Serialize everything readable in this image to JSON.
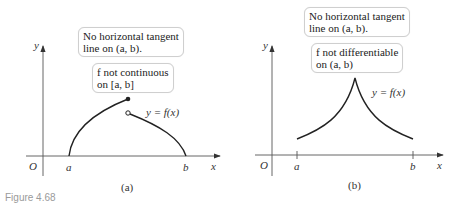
{
  "figure": {
    "caption": "Figure 4.68",
    "panels": [
      {
        "label": "(a)",
        "axis_labels": {
          "origin": "O",
          "x": "x",
          "y": "y",
          "a": "a",
          "b": "b"
        },
        "curve_label": "y = f(x)",
        "notes": [
          {
            "line1": "No horizontal tangent",
            "line2": "line on (a, b)."
          },
          {
            "line1": "f not continuous",
            "line2": "on [a, b]"
          }
        ],
        "markers": {
          "filled_point": "endpoint of left piece",
          "open_point": "start of right piece"
        }
      },
      {
        "label": "(b)",
        "axis_labels": {
          "origin": "O",
          "x": "x",
          "y": "y",
          "a": "a",
          "b": "b"
        },
        "curve_label": "y = f(x)",
        "notes": [
          {
            "line1": "No horizontal tangent",
            "line2": "line on (a, b)."
          },
          {
            "line1": "f  not differentiable",
            "line2": "on (a, b)"
          }
        ],
        "markers": {
          "cusp": "peak between a and b"
        }
      }
    ]
  }
}
